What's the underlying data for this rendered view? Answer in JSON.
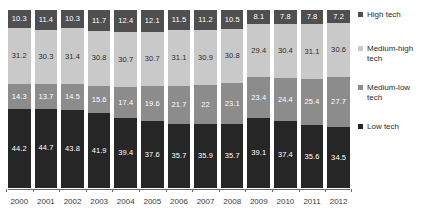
{
  "chart_data": {
    "type": "bar",
    "stacked": true,
    "normalized_percent": true,
    "title": "",
    "subtitle": "",
    "xlabel": "",
    "ylabel": "",
    "ylim": [
      0,
      100
    ],
    "grid": false,
    "legend_position": "right",
    "categories": [
      "2000",
      "2001",
      "2002",
      "2003",
      "2004",
      "2005",
      "2006",
      "2007",
      "2008",
      "2009",
      "2010",
      "2011",
      "2012"
    ],
    "series": [
      {
        "name": "High tech",
        "color": "#4f4f4f",
        "label_color": "#ffffff",
        "values": [
          10.3,
          11.4,
          10.3,
          11.7,
          12.4,
          12.1,
          11.5,
          11.2,
          10.5,
          8.1,
          7.8,
          7.8,
          7.2
        ],
        "labels": [
          "10.3",
          "11.4",
          "10.3",
          "11.7",
          "12.4",
          "12.1",
          "11.5",
          "11.2",
          "10.5",
          "8.1",
          "7.8",
          "7.8",
          "7.2"
        ]
      },
      {
        "name": "Medium-high tech",
        "color": "#c9c9c9",
        "label_color": "#2b2b2b",
        "values": [
          31.2,
          30.3,
          31.4,
          30.8,
          30.7,
          30.7,
          31.1,
          30.9,
          30.8,
          29.4,
          30.4,
          31.1,
          30.6
        ],
        "labels": [
          "31.2",
          "30.3",
          "31.4",
          "30.8",
          "30.7",
          "30.7",
          "31.1",
          "30.9",
          "30.8",
          "29.4",
          "30.4",
          "31.1",
          "30.6"
        ]
      },
      {
        "name": "Medium-low tech",
        "color": "#8c8c8c",
        "label_color": "#ffffff",
        "values": [
          14.3,
          13.7,
          14.5,
          15.6,
          17.4,
          19.6,
          21.7,
          22,
          23.1,
          23.4,
          24.4,
          25.4,
          27.7
        ],
        "labels": [
          "14.3",
          "13.7",
          "14.5",
          "15.6",
          "17.4",
          "19.6",
          "21.7",
          "22",
          "23.1",
          "23.4",
          "24.4",
          "25.4",
          "27.7"
        ]
      },
      {
        "name": "Low tech",
        "color": "#262626",
        "label_color": "#ffffff",
        "values": [
          44.2,
          44.7,
          43.8,
          41.9,
          39.4,
          37.6,
          35.7,
          35.9,
          35.7,
          39.1,
          37.4,
          35.6,
          34.5
        ],
        "labels": [
          "44.2",
          "44.7",
          "43.8",
          "41.9",
          "39.4",
          "37.6",
          "35.7",
          "35.9",
          "35.7",
          "39.1",
          "37.4",
          "35.6",
          "34.5"
        ]
      }
    ],
    "legend": [
      {
        "label": "High tech",
        "color": "#4f4f4f"
      },
      {
        "label": "Medium-high tech",
        "color": "#c9c9c9"
      },
      {
        "label": "Medium-low tech",
        "color": "#8c8c8c"
      },
      {
        "label": "Low tech",
        "color": "#262626"
      }
    ]
  }
}
